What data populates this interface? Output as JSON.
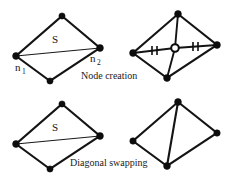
{
  "figure": {
    "background_color": "#ffffff",
    "line_color": "#141414",
    "width": 234,
    "height": 179,
    "captions": [
      {
        "id": "node-creation",
        "text": "Node creation",
        "x": 81,
        "y": 79
      },
      {
        "id": "diagonal-swapping",
        "text": "Diagonal swapping",
        "x": 70,
        "y": 166
      }
    ],
    "labels": {
      "segment_top": "S",
      "segment_bottom": "S",
      "node_1_base": "n",
      "node_1_sub": "1",
      "node_2_base": "n",
      "node_2_sub": "2"
    },
    "panels": [
      {
        "id": "top-left-before",
        "role": "node-creation-before",
        "vertices": [
          {
            "name": "top",
            "x": 62,
            "y": 16
          },
          {
            "name": "right",
            "x": 100,
            "y": 48
          },
          {
            "name": "bottom",
            "x": 50,
            "y": 81
          },
          {
            "name": "left",
            "x": 16,
            "y": 56
          }
        ],
        "diagonal": {
          "from": "left",
          "to": "right"
        },
        "marked_nodes": [
          "left",
          "right"
        ],
        "center_node": null,
        "ticks": []
      },
      {
        "id": "top-right-after",
        "role": "node-creation-after",
        "vertices": [
          {
            "name": "top",
            "x": 178,
            "y": 14
          },
          {
            "name": "right",
            "x": 217,
            "y": 45
          },
          {
            "name": "bottom",
            "x": 167,
            "y": 78
          },
          {
            "name": "left",
            "x": 133,
            "y": 53
          }
        ],
        "diagonal": null,
        "marked_nodes": [],
        "center_node": {
          "name": "new-node",
          "x": 175,
          "y": 48
        },
        "ticks": [
          {
            "id": "tick-left",
            "x": 154,
            "y": 50
          },
          {
            "id": "tick-right",
            "x": 196,
            "y": 46
          }
        ]
      },
      {
        "id": "bottom-left-before",
        "role": "diagonal-swapping-before",
        "vertices": [
          {
            "name": "top",
            "x": 62,
            "y": 104
          },
          {
            "name": "right",
            "x": 100,
            "y": 136
          },
          {
            "name": "bottom",
            "x": 50,
            "y": 169
          },
          {
            "name": "left",
            "x": 16,
            "y": 144
          }
        ],
        "diagonal": {
          "from": "left",
          "to": "right"
        },
        "marked_nodes": [],
        "center_node": null,
        "ticks": []
      },
      {
        "id": "bottom-right-after",
        "role": "diagonal-swapping-after",
        "vertices": [
          {
            "name": "top",
            "x": 178,
            "y": 102
          },
          {
            "name": "right",
            "x": 217,
            "y": 133
          },
          {
            "name": "bottom",
            "x": 167,
            "y": 166
          },
          {
            "name": "left",
            "x": 133,
            "y": 141
          }
        ],
        "diagonal": {
          "from": "top",
          "to": "bottom"
        },
        "marked_nodes": [],
        "center_node": null,
        "ticks": []
      }
    ],
    "s_label_positions": [
      {
        "x": 52,
        "y": 43
      },
      {
        "x": 52,
        "y": 131
      }
    ],
    "n_label_positions": [
      {
        "id": "n1",
        "x": 15,
        "y": 71
      },
      {
        "id": "n2",
        "x": 90,
        "y": 62
      }
    ]
  }
}
